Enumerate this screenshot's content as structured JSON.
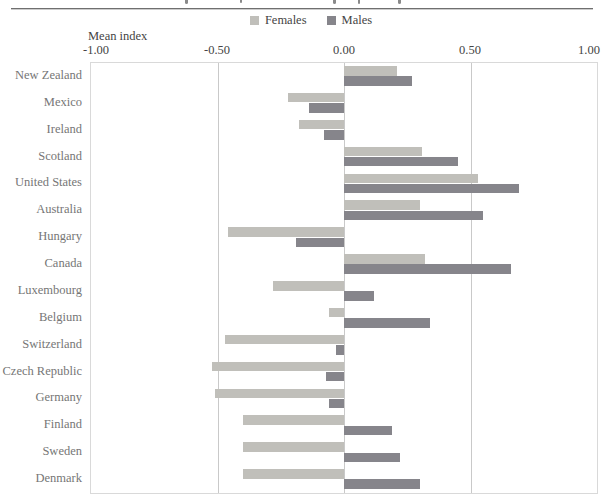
{
  "legend": {
    "items": [
      {
        "label": "Females"
      },
      {
        "label": "Males"
      }
    ]
  },
  "axis": {
    "title": "Mean index",
    "ticks": [
      "-1.00",
      "-0.50",
      "0.00",
      "0.50",
      "1.00"
    ]
  },
  "chart_data": {
    "type": "bar",
    "orientation": "horizontal",
    "title": "",
    "xlabel": "Mean index",
    "ylabel": "",
    "xlim": [
      -1.0,
      1.0
    ],
    "tick_step": 0.5,
    "gridlines": [
      -0.5,
      0.0,
      0.5
    ],
    "legend_position": "top",
    "grid": "vertical",
    "categories": [
      "New Zealand",
      "Mexico",
      "Ireland",
      "Scotland",
      "United States",
      "Australia",
      "Hungary",
      "Canada",
      "Luxembourg",
      "Belgium",
      "Switzerland",
      "Czech Republic",
      "Germany",
      "Finland",
      "Sweden",
      "Denmark"
    ],
    "series": [
      {
        "name": "Females",
        "color": "#c0bfba",
        "values": [
          0.21,
          -0.22,
          -0.18,
          0.31,
          0.53,
          0.3,
          -0.46,
          0.32,
          -0.28,
          -0.06,
          -0.47,
          -0.52,
          -0.51,
          -0.4,
          -0.4,
          -0.4
        ]
      },
      {
        "name": "Males",
        "color": "#86858b",
        "values": [
          0.27,
          -0.14,
          -0.08,
          0.45,
          0.69,
          0.55,
          -0.19,
          0.66,
          0.12,
          0.34,
          -0.03,
          -0.07,
          -0.06,
          0.19,
          0.22,
          0.3
        ]
      }
    ]
  }
}
